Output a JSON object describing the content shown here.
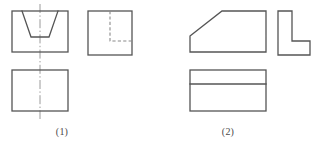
{
  "figure": {
    "background_color": "#ffffff",
    "visible_line_color": "#555555",
    "hidden_line_color": "#8a8a8a",
    "center_line_color": "#9a9a9a"
  },
  "groups": [
    {
      "id": "group-1",
      "caption": "(1)",
      "views": [
        {
          "name": "front-view",
          "shape": "rectangle with trapezoidal V-groove open at top",
          "outline": [
            [
              12,
              11
            ],
            [
              68,
              11
            ],
            [
              68,
              52
            ],
            [
              12,
              52
            ]
          ],
          "groove": [
            [
              22,
              11
            ],
            [
              31,
              37
            ],
            [
              49,
              37
            ],
            [
              58,
              11
            ]
          ]
        },
        {
          "name": "side-view",
          "shape": "square with hidden L-shaped edge",
          "outline": [
            [
              88,
              11
            ],
            [
              132,
              11
            ],
            [
              132,
              55
            ],
            [
              88,
              55
            ]
          ],
          "hidden": [
            [
              110,
              11
            ],
            [
              110,
              41
            ],
            [
              132,
              41
            ]
          ]
        },
        {
          "name": "top-view",
          "shape": "plain rectangle",
          "outline": [
            [
              12,
              70
            ],
            [
              68,
              70
            ],
            [
              68,
              111
            ],
            [
              12,
              111
            ]
          ]
        }
      ],
      "center_line": {
        "x": 40,
        "y1": 4,
        "y2": 119
      }
    },
    {
      "id": "group-2",
      "caption": "(2)",
      "views": [
        {
          "name": "front-view",
          "shape": "rectangle with chamfered upper-left corner",
          "outline": [
            [
              190,
              36
            ],
            [
              222,
              11
            ],
            [
              266,
              11
            ],
            [
              266,
              52
            ],
            [
              190,
              52
            ]
          ]
        },
        {
          "name": "side-view",
          "shape": "L-shaped profile",
          "outline": [
            [
              278,
              11
            ],
            [
              292,
              11
            ],
            [
              292,
              41
            ],
            [
              310,
              41
            ],
            [
              310,
              55
            ],
            [
              278,
              55
            ]
          ]
        },
        {
          "name": "top-view",
          "shape": "rectangle divided by one horizontal line",
          "outline": [
            [
              190,
              70
            ],
            [
              266,
              70
            ],
            [
              266,
              111
            ],
            [
              190,
              111
            ]
          ],
          "divider": [
            [
              190,
              84
            ],
            [
              266,
              84
            ]
          ]
        }
      ]
    }
  ]
}
